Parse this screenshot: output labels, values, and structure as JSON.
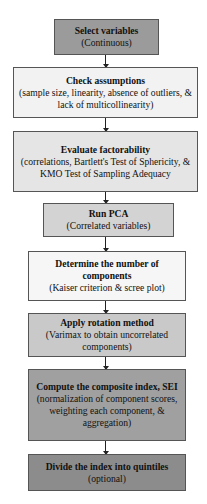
{
  "top_fragment": "…",
  "steps": [
    {
      "title": "Select variables",
      "detail": "(Continuous)",
      "fill": "#9b9b9b"
    },
    {
      "title": "Check assumptions",
      "detail": "(sample size, linearity, absence of outliers, & lack of multicollinearity)",
      "fill": "#f2f2f2"
    },
    {
      "title": "Evaluate factorability",
      "detail": "(correlations, Bartlett's Test of Sphericity, & KMO Test of Sampling Adequacy",
      "fill": "#e5e5e5"
    },
    {
      "title": "Run PCA",
      "detail": "(Correlated variables)",
      "fill": "#d3d3d3"
    },
    {
      "title": "Determine the number of components",
      "detail": "(Kaiser criterion & scree plot)",
      "fill": "#f6f6f6"
    },
    {
      "title": "Apply rotation method",
      "detail": "(Varimax to obtain uncorrelated components)",
      "fill": "#c9c9c9"
    },
    {
      "title": "Compute the composite index, SEI",
      "detail": "(normalization of component scores, weighting each component, & aggregation)",
      "fill": "#a0a0a0"
    },
    {
      "title": "Divide the index into quintiles",
      "detail": "(optional)",
      "fill": "#8c8c8c"
    }
  ]
}
